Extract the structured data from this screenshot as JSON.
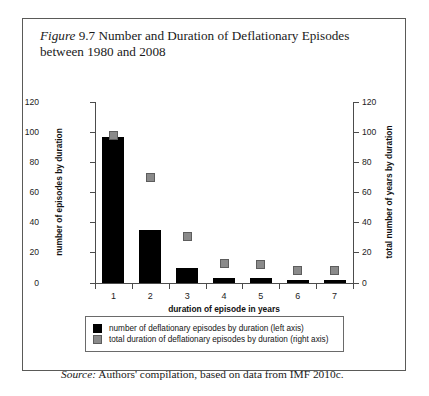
{
  "figure": {
    "label_italic": "Figure",
    "number": "9.7",
    "caption_rest": "Number and Duration of Deflationary Episodes between 1980 and 2008",
    "source_label": "Source:",
    "source_text": "Authors' compilation, based on data from IMF 2010c."
  },
  "legend": {
    "items": [
      {
        "swatch": "black",
        "label": "number of deflationary episodes by duration (left axis)"
      },
      {
        "swatch": "gray",
        "label": "total duration of deflationary episodes by duration (right axis)"
      }
    ]
  },
  "colors": {
    "bar": "#000000",
    "marker_fill": "#8a8a8a",
    "marker_edge": "#5d5d5d",
    "axis": "#4c4c4c",
    "frame": "#5a5a58"
  },
  "chart_data": {
    "type": "bar",
    "title": "Figure 9.7 Number and Duration of Deflationary Episodes between 1980 and 2008",
    "subtitle": "",
    "xlabel": "duration of episode in years",
    "ylabel": "number of episodes by duration",
    "y2label": "total number of years by duration",
    "categories": [
      "1",
      "2",
      "3",
      "4",
      "5",
      "6",
      "7"
    ],
    "ylim": [
      0,
      120
    ],
    "y2lim": [
      0,
      120
    ],
    "yticks": [
      0,
      20,
      40,
      60,
      80,
      100,
      120
    ],
    "y2ticks": [
      0,
      20,
      40,
      60,
      80,
      100,
      120
    ],
    "grid": false,
    "legend_position": "below-plot",
    "series": [
      {
        "name": "number of deflationary episodes by duration (left axis)",
        "axis": "left",
        "render": "bar",
        "color": "#000000",
        "values": [
          97,
          35,
          10,
          3,
          3,
          2,
          2
        ]
      },
      {
        "name": "total duration of deflationary episodes by duration (right axis)",
        "axis": "right",
        "render": "marker",
        "color": "#8a8a8a",
        "values": [
          98,
          70,
          31,
          13,
          12,
          8,
          8
        ]
      }
    ]
  }
}
